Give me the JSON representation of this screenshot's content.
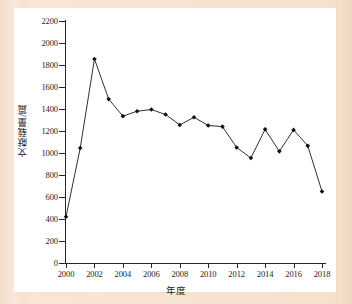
{
  "figure": {
    "background_color": "#f7e2cf",
    "plot_background_color": "#ffffff",
    "line_color": "#1a1a1a",
    "marker_color": "#111111"
  },
  "chart_data": {
    "type": "line",
    "title": "",
    "xlabel": "年度",
    "ylabel": "文献载量/篇",
    "xlim": [
      1999,
      2019
    ],
    "ylim": [
      0,
      2200
    ],
    "grid": false,
    "legend": null,
    "x_tick_labels": [
      "2000",
      "2002",
      "2004",
      "2006",
      "2008",
      "2010",
      "2012",
      "2014",
      "2016",
      "2018"
    ],
    "y_tick_labels": [
      "0",
      "200",
      "400",
      "600",
      "800",
      "1000",
      "1200",
      "1400",
      "1600",
      "1800",
      "2000",
      "2200"
    ],
    "x": [
      2000,
      2001,
      2002,
      2003,
      2004,
      2005,
      2006,
      2007,
      2008,
      2009,
      2010,
      2011,
      2012,
      2013,
      2014,
      2015,
      2016,
      2017,
      2018
    ],
    "values": [
      420,
      1045,
      1855,
      1490,
      1335,
      1380,
      1395,
      1350,
      1255,
      1325,
      1250,
      1240,
      1050,
      955,
      1215,
      1015,
      1210,
      1065,
      650
    ],
    "series": [
      {
        "name": "文献载量",
        "values": [
          420,
          1045,
          1855,
          1490,
          1335,
          1380,
          1395,
          1350,
          1255,
          1325,
          1250,
          1240,
          1050,
          955,
          1215,
          1015,
          1210,
          1065,
          650
        ]
      }
    ],
    "marker": "diamond",
    "annotations": []
  }
}
